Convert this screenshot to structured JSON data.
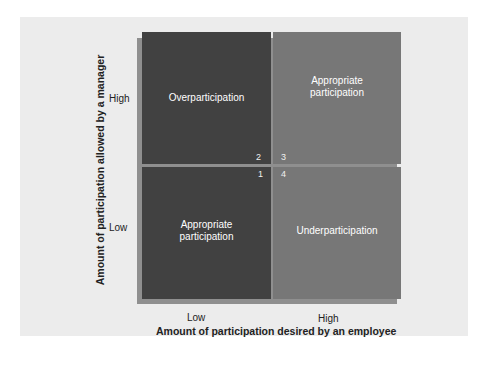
{
  "diagram": {
    "type": "2x2 matrix",
    "y_axis": {
      "title": "Amount of participation allowed by a manager",
      "ticks": [
        "High",
        "Low"
      ]
    },
    "x_axis": {
      "title": "Amount of participation desired by an employee",
      "ticks": [
        "Low",
        "High"
      ]
    },
    "quadrants": [
      {
        "number": "2",
        "label": "Overparticipation",
        "position": "top-left",
        "color": "#414141"
      },
      {
        "number": "3",
        "label": "Appropriate\nparticipation",
        "position": "top-right",
        "color": "#777777"
      },
      {
        "number": "1",
        "label": "Appropriate\nparticipation",
        "position": "bottom-left",
        "color": "#414141"
      },
      {
        "number": "4",
        "label": "Underparticipation",
        "position": "bottom-right",
        "color": "#777777"
      }
    ],
    "background_color": "#ececec"
  }
}
